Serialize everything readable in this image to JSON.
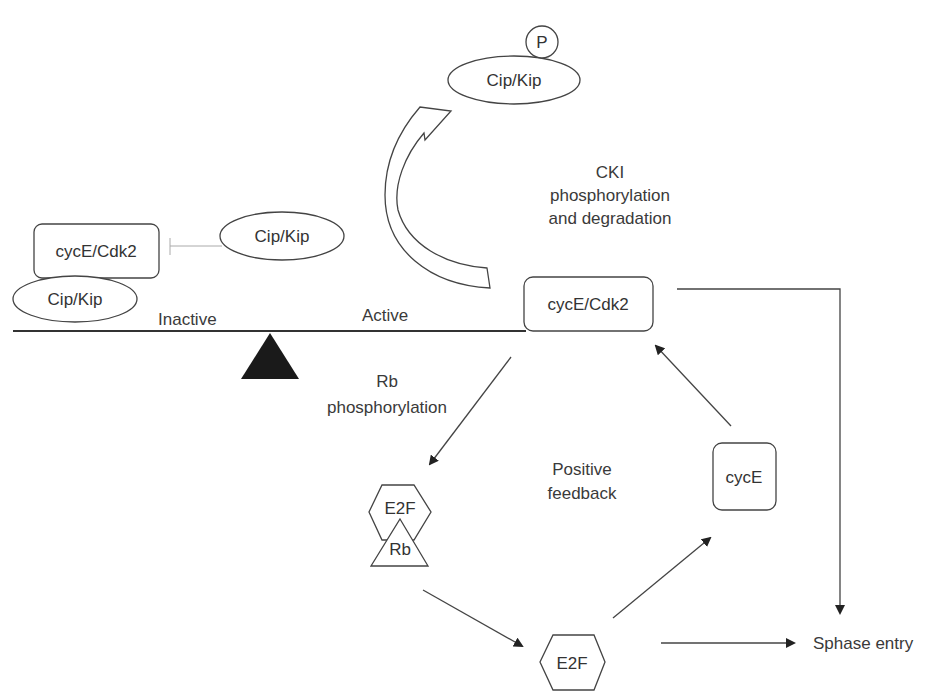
{
  "diagram": {
    "title": "",
    "nodes": {
      "cip_kip_phospho": {
        "label": "Cip/Kip",
        "modifier": "P"
      },
      "cyce_cdk2_inactive": {
        "label": "cycE/Cdk2"
      },
      "cip_kip_bound": {
        "label": "Cip/Kip"
      },
      "cip_kip_free": {
        "label": "Cip/Kip"
      },
      "cyce_cdk2_active": {
        "label": "cycE/Cdk2"
      },
      "cyce": {
        "label": "cycE"
      },
      "e2f_rb_complex": {
        "e2f": "E2F",
        "rb": "Rb"
      },
      "e2f_free": {
        "label": "E2F"
      },
      "sphase": {
        "label": "Sphase entry"
      }
    },
    "labels": {
      "cki_line1": "CKI",
      "cki_line2": "phosphorylation",
      "cki_line3": "and degradation",
      "inactive": "Inactive",
      "active": "Active",
      "rb_line1": "Rb",
      "rb_line2": "phosphorylation",
      "pf_line1": "Positive",
      "pf_line2": "feedback"
    },
    "colors": {
      "stroke": "#333333",
      "fulcrum": "#1a1a1a",
      "inhibit_line": "#aaaaaa"
    }
  }
}
